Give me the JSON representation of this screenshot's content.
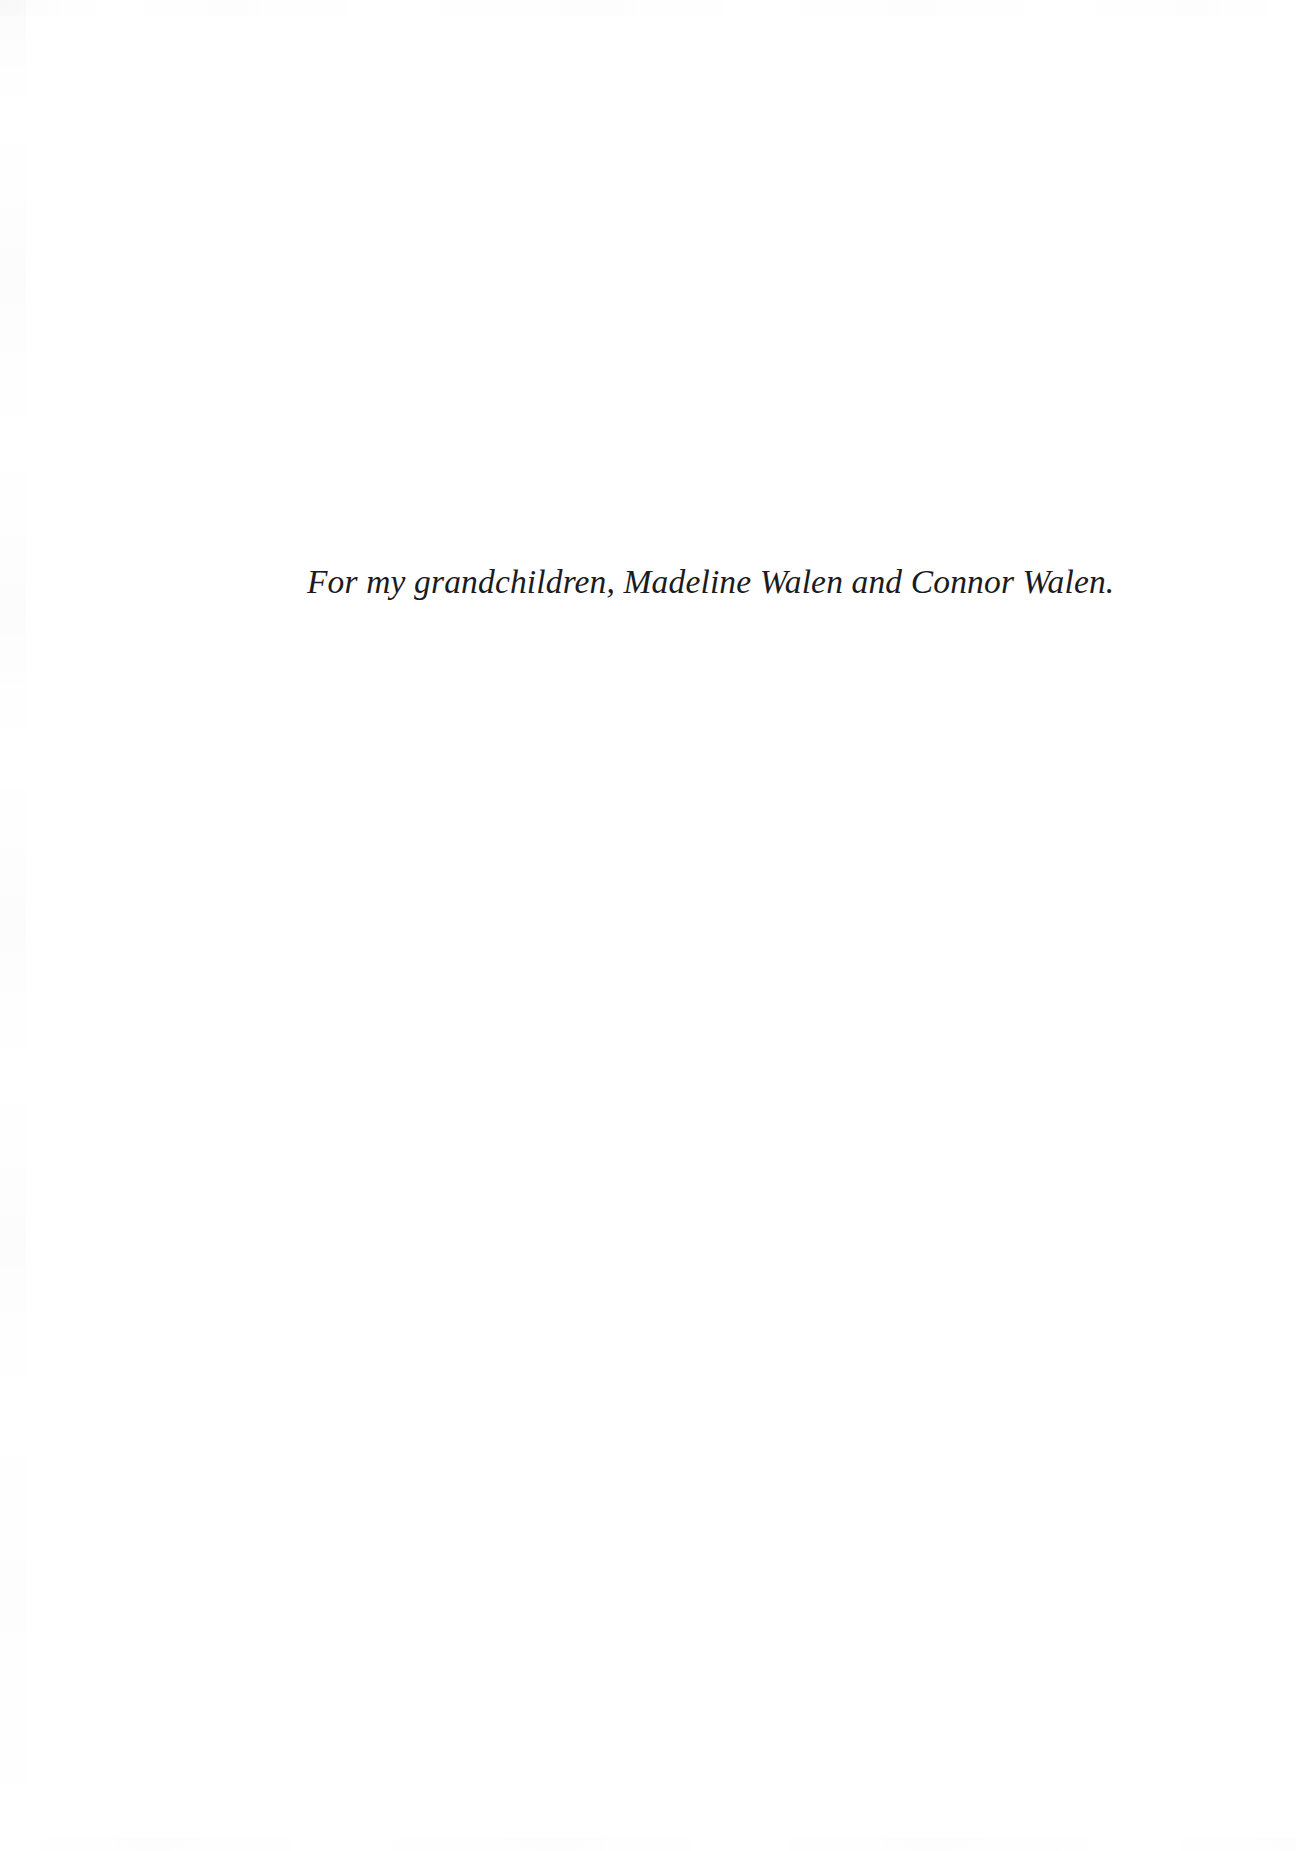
{
  "page": {
    "kind": "book-dedication-page",
    "background_color": "#ffffff",
    "width": 1296,
    "height": 1851
  },
  "dedication": {
    "text": "For my grandchildren, Madeline Walen and Connor Walen.",
    "style": "italic",
    "text_color": "#1b1b1d",
    "alignment": "left"
  }
}
